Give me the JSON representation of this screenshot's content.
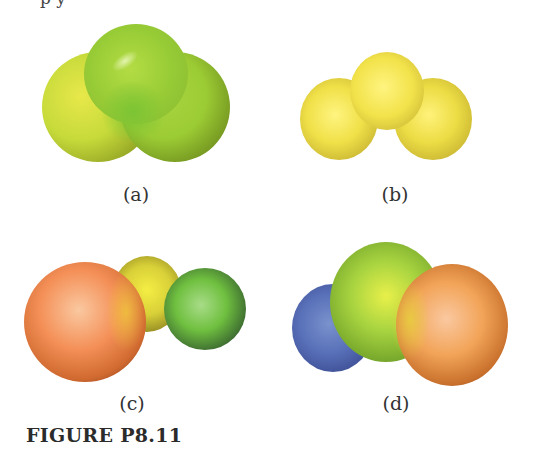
{
  "page": {
    "cutoff_text": "p       y"
  },
  "figure": {
    "caption": "FIGURE P8.11",
    "panels": [
      {
        "id": "a",
        "label": "(a)",
        "description": "bent triatomic electrostatic potential map, mostly green/yellow-green",
        "colors": [
          "#c8dc3c",
          "#8ccc30",
          "#e6e040"
        ]
      },
      {
        "id": "b",
        "label": "(b)",
        "description": "bent triatomic electrostatic potential map, uniformly yellow",
        "colors": [
          "#f2e450",
          "#e8d840",
          "#fff27a"
        ]
      },
      {
        "id": "c",
        "label": "(c)",
        "description": "linear-bent triatomic map, orange-red left, yellow center, green-blue right",
        "colors": [
          "#f08a50",
          "#e8e040",
          "#6cc040",
          "#1e2a50"
        ]
      },
      {
        "id": "d",
        "label": "(d)",
        "description": "bent triatomic map, blue left, green/yellow center, orange-red right",
        "colors": [
          "#5870b8",
          "#8cc838",
          "#f0a850",
          "#8a3a20"
        ]
      }
    ]
  }
}
